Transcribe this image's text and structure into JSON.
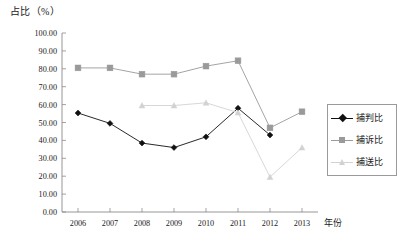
{
  "chart_data": {
    "type": "line",
    "title": "",
    "ylabel": "占比（%）",
    "xlabel": "年份",
    "categories": [
      "2006",
      "2007",
      "2008",
      "2009",
      "2010",
      "2011",
      "2012",
      "2013"
    ],
    "ylim": [
      0,
      100
    ],
    "ytick_labels": [
      "100.00",
      "90.00",
      "80.00",
      "70.00",
      "60.00",
      "50.00",
      "40.00",
      "30.00",
      "20.00",
      "10.00",
      "0.00"
    ],
    "ytick_values": [
      100,
      90,
      80,
      70,
      60,
      50,
      40,
      30,
      20,
      10,
      0
    ],
    "grid": false,
    "legend_position": "right",
    "series": [
      {
        "name": "捕判比",
        "marker": "diamond",
        "color": "#111111",
        "values": [
          55.3,
          49.5,
          38.5,
          36.0,
          42.0,
          58.0,
          43.0,
          null
        ]
      },
      {
        "name": "捕诉比",
        "marker": "square",
        "color": "#9a9a9a",
        "values": [
          80.5,
          80.5,
          77.0,
          77.0,
          81.5,
          84.5,
          47.0,
          56.0
        ]
      },
      {
        "name": "捕送比",
        "marker": "triangle",
        "color": "#d2d2d2",
        "values": [
          null,
          null,
          59.5,
          59.5,
          61.0,
          55.5,
          19.5,
          36.0
        ]
      }
    ]
  },
  "legend": {
    "items": [
      {
        "label": "捕判比",
        "color": "#111111",
        "marker": "diamond"
      },
      {
        "label": "捕诉比",
        "color": "#9a9a9a",
        "marker": "square"
      },
      {
        "label": "捕送比",
        "color": "#d2d2d2",
        "marker": "triangle"
      }
    ]
  }
}
